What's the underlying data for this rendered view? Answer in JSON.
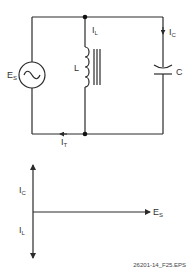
{
  "circuit": {
    "source": {
      "label": "E",
      "sub": "S",
      "symbol": "~"
    },
    "inductor": {
      "label": "L",
      "current_label": "I",
      "current_sub": "L"
    },
    "capacitor": {
      "label": "C",
      "current_label": "I",
      "current_sub": "C"
    },
    "total_current": {
      "label": "I",
      "sub": "T"
    }
  },
  "phasor": {
    "up_label": "I",
    "up_sub": "C",
    "down_label": "I",
    "down_sub": "L",
    "right_label": "E",
    "right_sub": "S"
  },
  "caption": "26201-14_F25.EPS",
  "colors": {
    "line": "#2a2a2a",
    "text": "#333333"
  }
}
